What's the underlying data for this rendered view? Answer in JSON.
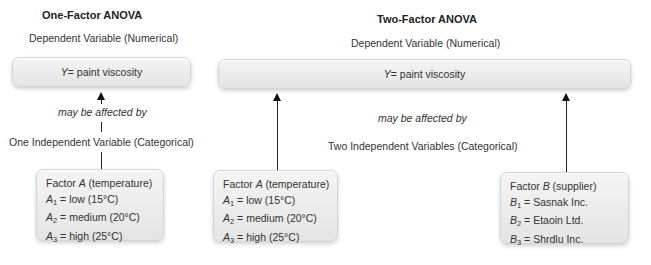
{
  "one_factor": {
    "title": "One-Factor ANOVA",
    "dependent_label": "Dependent Variable (Numerical)",
    "y_box": {
      "symbol": "Y",
      "text": " = paint viscosity"
    },
    "relation": "may be affected by",
    "independent_label": "One Independent Variable (Categorical)",
    "factor_a": {
      "heading_prefix": "Factor ",
      "heading_symbol": "A",
      "heading_suffix": " (temperature)",
      "levels": [
        {
          "symbol": "A",
          "sub": "1",
          "text": " = low (15°C)"
        },
        {
          "symbol": "A",
          "sub": "2",
          "text": " = medium (20°C)"
        },
        {
          "symbol": "A",
          "sub": "3",
          "text": " = high (25°C)"
        }
      ]
    }
  },
  "two_factor": {
    "title": "Two-Factor ANOVA",
    "dependent_label": "Dependent Variable (Numerical)",
    "y_box": {
      "symbol": "Y",
      "text": " = paint viscosity"
    },
    "relation": "may be affected by",
    "independent_label": "Two Independent Variables (Categorical)",
    "factor_a": {
      "heading_prefix": "Factor ",
      "heading_symbol": "A",
      "heading_suffix": " (temperature)",
      "levels": [
        {
          "symbol": "A",
          "sub": "1",
          "text": " = low (15°C)"
        },
        {
          "symbol": "A",
          "sub": "2",
          "text": " = medium (20°C)"
        },
        {
          "symbol": "A",
          "sub": "3",
          "text": " = high (25°C)"
        }
      ]
    },
    "factor_b": {
      "heading_prefix": "Factor ",
      "heading_symbol": "B",
      "heading_suffix": " (supplier)",
      "levels": [
        {
          "symbol": "B",
          "sub": "1",
          "text": " = Sasnak Inc."
        },
        {
          "symbol": "B",
          "sub": "2",
          "text": " = Etaoin Ltd."
        },
        {
          "symbol": "B",
          "sub": "3",
          "text": " = Shrdlu Inc."
        }
      ]
    }
  }
}
